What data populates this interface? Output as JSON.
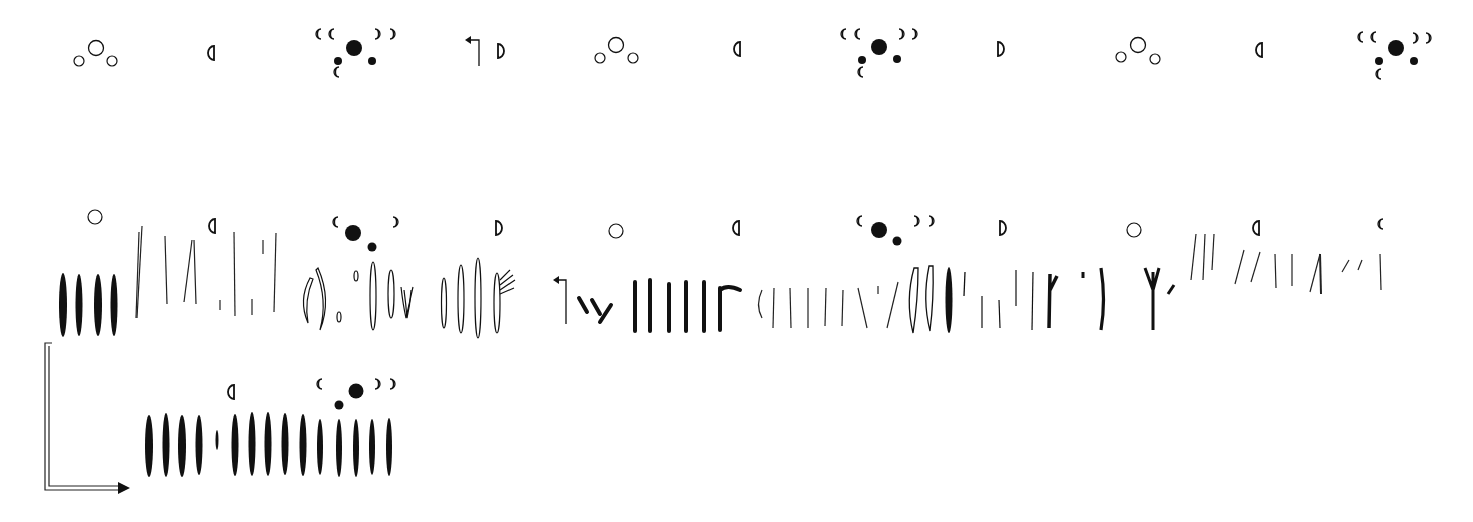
{
  "diagram": {
    "type": "lunar-tally-sequence",
    "ink_color": "#111111",
    "top_row": {
      "description": "Sequence of lunar phase symbols over segments with day counts, joined by zigzag line",
      "segments": [
        {
          "x1": 96,
          "x2": 202,
          "y": 72,
          "count": "7"
        },
        {
          "x1": 218,
          "x2": 322,
          "y": 72,
          "count": "7"
        },
        {
          "x1": 338,
          "x2": 346,
          "y": 71,
          "count": "1"
        },
        {
          "x1": 355,
          "x2": 373,
          "y": 71,
          "count": "2"
        },
        {
          "x1": 389,
          "x2": 461,
          "y": 71,
          "count": "5"
        },
        {
          "x1": 496,
          "x2": 601,
          "y": 70,
          "count": "7"
        },
        {
          "x1": 617,
          "x2": 722,
          "y": 70,
          "count": "7"
        },
        {
          "x1": 738,
          "x2": 846,
          "y": 69,
          "count": "7"
        },
        {
          "x1": 878,
          "x2": 898,
          "y": 69,
          "count": "2"
        },
        {
          "x1": 913,
          "x2": 983,
          "y": 69,
          "count": "5"
        },
        {
          "x1": 1000,
          "x2": 1118,
          "y": 69,
          "count": "8"
        },
        {
          "x1": 1137,
          "x2": 1240,
          "y": 70,
          "count": "7"
        },
        {
          "x1": 1258,
          "x2": 1364,
          "y": 70,
          "count": "7"
        },
        {
          "x1": 1377,
          "x2": 1385,
          "y": 70,
          "count": "1"
        },
        {
          "x1": 1397,
          "x2": 1414,
          "y": 70,
          "count": "2"
        }
      ],
      "zigzag_points": [
        [
          98,
          92
        ],
        [
          355,
          160
        ],
        [
          617,
          88
        ],
        [
          878,
          158
        ],
        [
          1137,
          87
        ],
        [
          1398,
          159
        ]
      ]
    },
    "middle_row": {
      "groups": [
        {
          "x1": 60,
          "x2": 120,
          "count": "4",
          "marks": "solid"
        },
        {
          "x1": 132,
          "x2": 286,
          "count": "10",
          "marks": "thin"
        },
        {
          "x1": 303,
          "x2": 427,
          "count": "8",
          "marks": "outline"
        },
        {
          "x1": 442,
          "x2": 549,
          "count": "7",
          "marks": "outline"
        },
        {
          "x1": 584,
          "x2": 740,
          "count": "10",
          "marks": "bold"
        },
        {
          "x1": 758,
          "x2": 897,
          "count": "9",
          "marks": "thin"
        },
        {
          "x1": 912,
          "x2": 931,
          "count": "2",
          "marks": "outline"
        },
        {
          "x1": 945,
          "x2": 1173,
          "count": "14",
          "marks": "mixed"
        },
        {
          "x1": 1188,
          "x2": 1381,
          "count": "12",
          "marks": "thin"
        }
      ]
    },
    "bottom_row": {
      "groups": [
        {
          "x1": 147,
          "x2": 200,
          "count": "4",
          "marks": "solid"
        },
        {
          "x1": 216,
          "x2": 303,
          "count": "6",
          "marks": "solid"
        },
        {
          "x1": 320,
          "x2": 390,
          "count": "5",
          "marks": "solid"
        }
      ]
    },
    "legend_symbols": [
      "full-moon-circle",
      "first-quarter-half-moon",
      "last-quarter-half-moon",
      "crescent-waxing",
      "crescent-waning",
      "new-moon-dots",
      "turn-arrow"
    ]
  }
}
